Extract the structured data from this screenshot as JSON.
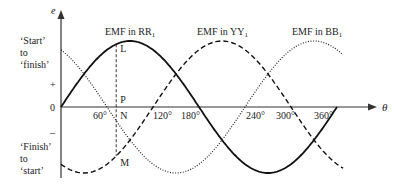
{
  "diagram": {
    "axis": {
      "y_label": "e",
      "x_label": "θ",
      "plus": "+",
      "zero": "0",
      "minus": "–",
      "ticks": [
        "60°",
        "120°",
        "180°",
        "240°",
        "300°",
        "360°"
      ]
    },
    "side_labels": {
      "top": [
        "‘Start’",
        "to",
        "‘finish’"
      ],
      "bottom": [
        "‘Finish’",
        "to",
        "‘start’"
      ]
    },
    "series": [
      {
        "name": "EMF in RR",
        "subscript": "1",
        "style": "solid",
        "phase_deg": 0
      },
      {
        "name": "EMF in YY",
        "subscript": "1",
        "style": "dashed",
        "phase_deg": 120
      },
      {
        "name": "EMF in BB",
        "subscript": "1",
        "style": "dotted",
        "phase_deg": 240
      }
    ],
    "points": {
      "L": "L",
      "P": "P",
      "N": "N",
      "M": "M"
    },
    "marker_angle_deg": 72,
    "colors": {
      "line": "#111111",
      "text": "#222222"
    }
  }
}
